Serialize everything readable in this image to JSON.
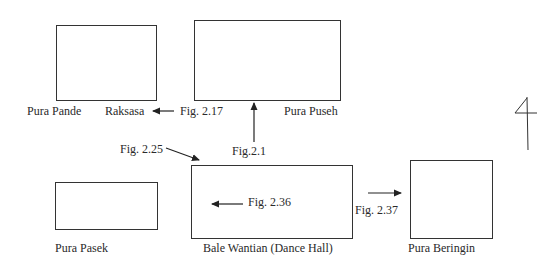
{
  "diagram": {
    "type": "site-plan",
    "buildings": [
      {
        "id": "raksasa",
        "label": "Raksasa"
      },
      {
        "id": "pura-puseh",
        "label": "Pura Puseh"
      },
      {
        "id": "pura-pasek",
        "label": "Pura Pasek"
      },
      {
        "id": "bale-wantian",
        "label": "Bale Wantian (Dance Hall)"
      },
      {
        "id": "pura-beringin",
        "label": "Pura Beringin"
      }
    ],
    "extra_labels": {
      "pura_pande": "Pura Pande"
    },
    "figure_refs": {
      "fig_2_17": "Fig. 2.17",
      "fig_2_1": "Fig.2.1",
      "fig_2_25": "Fig. 2.25",
      "fig_2_36": "Fig. 2.36",
      "fig_2_37": "Fig. 2.37"
    },
    "handwritten_mark": "4",
    "stroke_color": "#333333"
  }
}
